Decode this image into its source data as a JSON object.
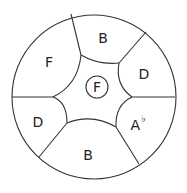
{
  "diagram": {
    "type": "handpan-note-layout",
    "center_note": "F",
    "notes": [
      {
        "id": "top",
        "label": "B",
        "x": 103,
        "y": 38
      },
      {
        "id": "upper-left",
        "label": "F",
        "x": 49,
        "y": 62
      },
      {
        "id": "upper-right",
        "label": "D",
        "x": 144,
        "y": 74
      },
      {
        "id": "lower-left",
        "label": "D",
        "x": 38,
        "y": 122
      },
      {
        "id": "lower-right",
        "label": "A",
        "accidental": "♭",
        "x": 137,
        "y": 125
      },
      {
        "id": "bottom",
        "label": "B",
        "x": 88,
        "y": 155
      }
    ]
  }
}
